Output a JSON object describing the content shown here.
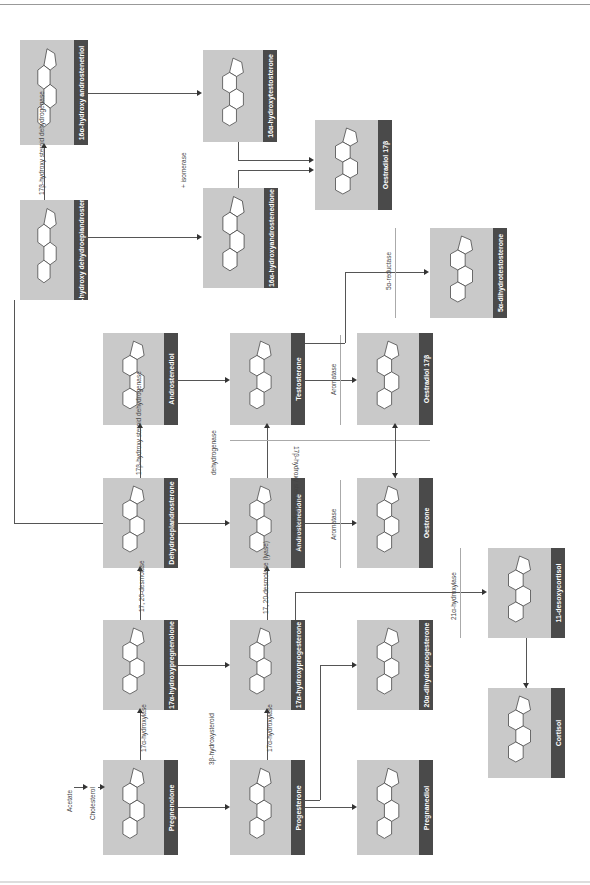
{
  "diagram": {
    "orientation": "rotated 90 degrees (read bottom-to-top)",
    "compounds": [
      {
        "id": "androstenetriol16",
        "label": "16α-hydroxy androstenetriol",
        "substituents": [
          "OH",
          "OH",
          "HO"
        ]
      },
      {
        "id": "dhea16",
        "label": "16α-hydroxy dehydroepiandrosterone",
        "substituents": [
          "O",
          "OH",
          "HO"
        ]
      },
      {
        "id": "testosterone16",
        "label": "16α-hydroxytestosterone",
        "substituents": [
          "OH",
          "OH",
          "O"
        ]
      },
      {
        "id": "androstenedione16",
        "label": "16α-hydroxyandrostenedione",
        "substituents": [
          "O",
          "OH",
          "O"
        ]
      },
      {
        "id": "oestriol",
        "label": "Oestradiol 17β",
        "substituents": [
          "OH",
          "HO"
        ]
      },
      {
        "id": "dht",
        "label": "5α-dihydrotestosterone",
        "substituents": [
          "OH",
          "O"
        ]
      },
      {
        "id": "androstenediol",
        "label": "Androstenediol",
        "substituents": [
          "OH",
          "HO"
        ]
      },
      {
        "id": "testosterone",
        "label": "Testosterone",
        "substituents": [
          "OH",
          "O"
        ]
      },
      {
        "id": "oestradiol",
        "label": "Oestradiol 17β",
        "substituents": [
          "OH",
          "HO"
        ]
      },
      {
        "id": "dhea",
        "label": "Dehydroepiandrosterone",
        "substituents": [
          "O",
          "HO"
        ]
      },
      {
        "id": "androstenedione",
        "label": "Androstenedione",
        "substituents": [
          "O",
          "O"
        ]
      },
      {
        "id": "oestrone",
        "label": "Oestrone",
        "substituents": [
          "O",
          "HO"
        ]
      },
      {
        "id": "deoxycortisol",
        "label": "11-desoxycortisol",
        "substituents": [
          "CH2OH",
          "C=O",
          "OH",
          "O"
        ]
      },
      {
        "id": "hydroxypregnenolone",
        "label": "17α-hydroxypregnenolone",
        "substituents": [
          "CH3",
          "C=O",
          "OH",
          "HO"
        ]
      },
      {
        "id": "hydroxyprogesterone",
        "label": "17α-hydroxyprogesterone",
        "substituents": [
          "CH3",
          "C=O",
          "OH",
          "O"
        ]
      },
      {
        "id": "dihydroprogesterone",
        "label": "20α-dihydroprogesterone",
        "substituents": [
          "CH3",
          "HC-OH",
          "OH",
          "O"
        ]
      },
      {
        "id": "cortisol",
        "label": "Cortisol",
        "substituents": [
          "CH2OH",
          "C=O",
          "OH",
          "HO",
          "O"
        ]
      },
      {
        "id": "pregnenolone",
        "label": "Pregnenolone",
        "substituents": [
          "CH3",
          "C=O",
          "HO"
        ]
      },
      {
        "id": "progesterone",
        "label": "Progesterone",
        "substituents": [
          "CH3",
          "C=O",
          "O"
        ]
      },
      {
        "id": "pregnanediol",
        "label": "Pregnanediol",
        "substituents": [
          "CH3",
          "HC-OH",
          "HO"
        ]
      }
    ],
    "enzymes": {
      "hsd17_top": "17β-hydroxy steroid dehydrogenase",
      "hsd17_mid": "17β-hydroxy steroid dehydrogenase",
      "hsd17_strip": "17β-hydroxy steroid dehydrogenase",
      "isomerase": "+ isomerase",
      "reductase": "5α-reductase",
      "aromatase_top": "Aromatase",
      "aromatase_bottom": "Aromatase",
      "dehydrogenase": "dehydrogenase",
      "desmolase": "17, 20-desmolase",
      "desmolase_lyase": "17, 20-desmolase (lyase)",
      "hydroxylase17_a": "17α-hydroxylase",
      "hydroxylase17_b": "17α-hydroxylase",
      "hsd3": "3β-hydroxysteroid",
      "hydroxylase21": "21α-hydroxylase"
    },
    "precursors": {
      "acetate": "Acetate",
      "cholesterol": "Cholesterol"
    }
  }
}
